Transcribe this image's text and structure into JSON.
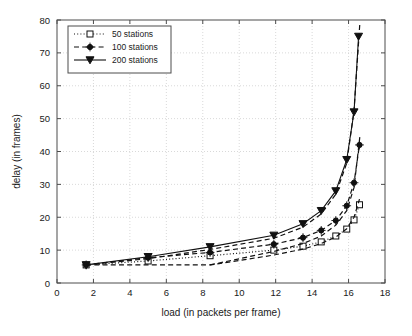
{
  "chart_data": {
    "type": "line",
    "title": "",
    "xlabel": "load (in packets per frame)",
    "ylabel": "delay (in frames)",
    "xlim": [
      0,
      18
    ],
    "ylim": [
      0,
      80
    ],
    "xticks": [
      0,
      2,
      4,
      6,
      8,
      10,
      12,
      14,
      16,
      18
    ],
    "yticks": [
      0,
      10,
      20,
      30,
      40,
      50,
      60,
      70,
      80
    ],
    "xticklabels": [
      "0",
      "2",
      "4",
      "6",
      "8",
      "10",
      "12",
      "14",
      "16",
      "18"
    ],
    "yticklabels": [
      "0",
      "10",
      "20",
      "30",
      "40",
      "50",
      "60",
      "70",
      "80"
    ],
    "grid": true,
    "legend_position": "upper left",
    "series": [
      {
        "name": "50 stations",
        "marker": "square-open",
        "linestyle": "dotted",
        "color": "#111111",
        "x": [
          1.6,
          5.0,
          8.4,
          11.9,
          13.5,
          14.5,
          15.3,
          15.9,
          16.3,
          16.6
        ],
        "y": [
          5.5,
          6.7,
          8.3,
          10.0,
          11.2,
          12.5,
          14.3,
          16.4,
          19.2,
          23.8
        ]
      },
      {
        "name": "100 stations",
        "marker": "circle-filled",
        "linestyle": "dashed",
        "color": "#111111",
        "x": [
          1.6,
          5.0,
          8.4,
          11.9,
          13.5,
          14.5,
          15.3,
          15.9,
          16.3,
          16.6
        ],
        "y": [
          5.5,
          7.7,
          9.3,
          11.8,
          13.8,
          16.0,
          19.0,
          23.5,
          30.5,
          42.0
        ]
      },
      {
        "name": "200 stations",
        "marker": "triangle-down-filled",
        "linestyle": "solid",
        "color": "#111111",
        "x": [
          1.6,
          5.0,
          8.4,
          11.9,
          13.5,
          14.5,
          15.3,
          15.9,
          16.3,
          16.55
        ],
        "y": [
          5.5,
          8.0,
          11.0,
          14.5,
          18.0,
          22.0,
          28.0,
          37.5,
          52.0,
          75.0
        ]
      },
      {
        "name": "50 stations (lower branch)",
        "marker": "none",
        "linestyle": "dashed",
        "color": "#111111",
        "x": [
          1.6,
          5.0,
          8.4,
          11.9,
          13.5,
          14.5,
          15.3,
          15.9,
          16.3,
          16.6
        ],
        "y": [
          5.5,
          5.5,
          5.5,
          8.5,
          10.3,
          12.0,
          14.0,
          16.5,
          20.0,
          25.5
        ]
      },
      {
        "name": "100 stations (upper branch)",
        "marker": "none",
        "linestyle": "dashed",
        "color": "#111111",
        "x": [
          8.4,
          11.9,
          13.5,
          14.5,
          15.3,
          15.9,
          16.3,
          16.62
        ],
        "y": [
          5.5,
          9.6,
          12.0,
          14.3,
          17.6,
          22.0,
          29.0,
          44.5
        ]
      },
      {
        "name": "200 stations (upper branch)",
        "marker": "none",
        "linestyle": "dashed",
        "color": "#111111",
        "x": [
          1.6,
          5.0,
          8.4,
          11.9,
          13.5,
          14.5,
          15.3,
          15.9,
          16.3,
          16.62
        ],
        "y": [
          5.5,
          7.4,
          10.2,
          13.6,
          17.0,
          21.0,
          27.0,
          36.5,
          52.5,
          79.0
        ]
      }
    ],
    "legend_entries": [
      {
        "label": "50 stations",
        "marker": "square-open",
        "linestyle": "dotted"
      },
      {
        "label": "100 stations",
        "marker": "circle-filled",
        "linestyle": "dashed"
      },
      {
        "label": "200 stations",
        "marker": "triangle-down-filled",
        "linestyle": "solid"
      }
    ]
  }
}
